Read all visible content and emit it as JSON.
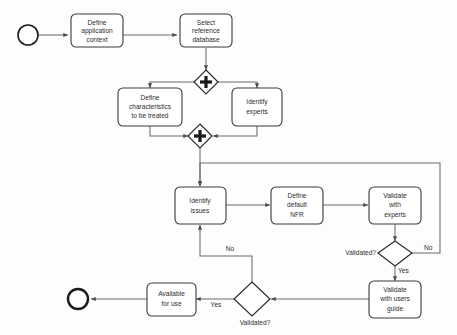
{
  "diagram": {
    "type": "bpmn-process-flowchart",
    "colors": {
      "background": "#fdfdfd",
      "shape_fill": "#ffffff",
      "shape_stroke": "#3a3a3a",
      "connector_stroke": "#6b6b6b",
      "text": "#2d2d2d"
    },
    "events": [
      {
        "id": "start",
        "kind": "start-event",
        "label": ""
      },
      {
        "id": "end",
        "kind": "end-event",
        "label": ""
      }
    ],
    "gateways": [
      {
        "id": "gw-split",
        "kind": "parallel-gateway",
        "symbol": "+",
        "label": ""
      },
      {
        "id": "gw-join",
        "kind": "parallel-gateway",
        "symbol": "+",
        "label": ""
      },
      {
        "id": "gw-validated-experts",
        "kind": "exclusive-gateway",
        "label": "Validated?"
      },
      {
        "id": "gw-validated-users",
        "kind": "exclusive-gateway",
        "label": "Validated?"
      }
    ],
    "tasks": [
      {
        "id": "define-application-context",
        "lines": [
          "Define",
          "application",
          "context"
        ]
      },
      {
        "id": "select-reference-database",
        "lines": [
          "Select",
          "reference",
          "database"
        ]
      },
      {
        "id": "define-characteristics",
        "lines": [
          "Define",
          "characteristics",
          "to be treated"
        ]
      },
      {
        "id": "identify-experts",
        "lines": [
          "Identify",
          "experts"
        ]
      },
      {
        "id": "identify-issues",
        "lines": [
          "Identify",
          "issues"
        ]
      },
      {
        "id": "define-default-nfr",
        "lines": [
          "Define",
          "default",
          "NFR"
        ]
      },
      {
        "id": "validate-with-experts",
        "lines": [
          "Validate",
          "with",
          "experts"
        ]
      },
      {
        "id": "validate-with-users-guide",
        "lines": [
          "Validate",
          "with users",
          "guide"
        ]
      },
      {
        "id": "available-for-use",
        "lines": [
          "Available",
          "for use"
        ]
      }
    ],
    "edge_labels": {
      "experts_no": "No",
      "experts_yes": "Yes",
      "users_no": "No",
      "users_yes": "Yes"
    }
  }
}
